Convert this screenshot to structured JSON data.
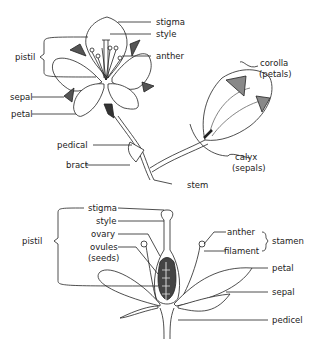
{
  "top_diagram": {
    "labels": {
      "stigma": "stigma",
      "style": "style",
      "anther": "anther",
      "pistil": "pistil",
      "sepal": "sepal",
      "petal": "petal",
      "pedical": "pedical",
      "bract": "bract",
      "stem": "stem",
      "corolla": "corolla",
      "corolla_sub": "(petals)",
      "calyx": "calyx",
      "calyx_sub": "(sepals)"
    }
  },
  "bottom_diagram": {
    "labels": {
      "stigma": "stigma",
      "style": "style",
      "ovary": "ovary",
      "ovules": "ovules",
      "ovules_sub": "(seeds)",
      "pistil": "pistil",
      "anther": "anther",
      "filament": "filament",
      "stamen": "stamen",
      "petal": "petal",
      "sepal": "sepal",
      "pedicel": "pedicel"
    }
  },
  "colors": {
    "ink": "#222222",
    "shade": "#666666",
    "background": "#ffffff"
  }
}
